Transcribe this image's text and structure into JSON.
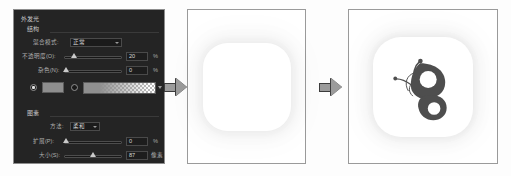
{
  "dialog": {
    "title": "外发光",
    "sections": {
      "structure": "结构",
      "elements": "图素"
    },
    "rows": {
      "blend_mode": {
        "label": "混合模式:",
        "value": "正常"
      },
      "opacity": {
        "label": "不透明度(O):",
        "value": "20",
        "unit": "%"
      },
      "noise": {
        "label": "杂色(N):",
        "value": "0",
        "unit": "%"
      },
      "method": {
        "label": "方法:",
        "value": "柔和"
      },
      "spread": {
        "label": "扩展(P):",
        "value": "0",
        "unit": "%"
      },
      "size": {
        "label": "大小(S):",
        "value": "87",
        "unit": "像素"
      }
    },
    "fill": {
      "color_radio_selected": true,
      "gradient_radio_selected": false,
      "color_hex": "#8e8e8e",
      "gradient_from_hex": "#8f8f8f",
      "gradient_to": "transparent"
    },
    "colors": {
      "panel_bg": "#242424",
      "panel_border": "#8d8d8d",
      "text": "#b9b9b9",
      "field_bg": "#1b1b1b",
      "field_border": "#4a4a4a",
      "thumb": "#c9c9c9"
    }
  },
  "flow": {
    "arrow_1": "arrow-right",
    "arrow_2": "arrow-right",
    "arrow_color": "#9b9b9b"
  },
  "previews": [
    {
      "id": "glow-only",
      "name": "白色圆角方块（外发光）",
      "shape": "squircle",
      "fill_hex": "#ffffff",
      "has_glow": true,
      "has_logo": false
    },
    {
      "id": "glow-with-logo",
      "name": "蝴蝶图标（外发光）",
      "shape": "squircle",
      "fill_hex": "#ffffff",
      "has_glow": true,
      "has_logo": true,
      "logo": {
        "name": "butterfly-logo",
        "color_hex": "#4a4a4a"
      }
    }
  ]
}
